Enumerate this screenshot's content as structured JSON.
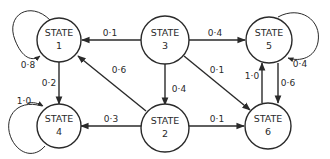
{
  "diagram": {
    "type": "state-transition-diagram",
    "nodes": [
      {
        "id": "1",
        "line1": "STATE",
        "line2": "1"
      },
      {
        "id": "2",
        "line1": "STATE",
        "line2": "2"
      },
      {
        "id": "3",
        "line1": "STATE",
        "line2": "3"
      },
      {
        "id": "4",
        "line1": "STATE",
        "line2": "4"
      },
      {
        "id": "5",
        "line1": "STATE",
        "line2": "5"
      },
      {
        "id": "6",
        "line1": "STATE",
        "line2": "6"
      }
    ],
    "edges": [
      {
        "from": "1",
        "to": "1",
        "label": "0·8"
      },
      {
        "from": "3",
        "to": "1",
        "label": "0·1"
      },
      {
        "from": "3",
        "to": "5",
        "label": "0·4"
      },
      {
        "from": "5",
        "to": "5",
        "label": "0·4"
      },
      {
        "from": "1",
        "to": "4",
        "label": "0·2"
      },
      {
        "from": "2",
        "to": "1",
        "label": "0·6"
      },
      {
        "from": "3",
        "to": "2",
        "label": "0·4"
      },
      {
        "from": "3",
        "to": "6",
        "label": "0·1"
      },
      {
        "from": "6",
        "to": "5",
        "label": "1·0"
      },
      {
        "from": "5",
        "to": "6",
        "label": "0·6"
      },
      {
        "from": "4",
        "to": "4",
        "label": "1·0"
      },
      {
        "from": "2",
        "to": "4",
        "label": "0·3"
      },
      {
        "from": "2",
        "to": "6",
        "label": "0·1"
      }
    ]
  },
  "colors": {
    "stroke": "#2a2a2a",
    "background": "#ffffff"
  }
}
